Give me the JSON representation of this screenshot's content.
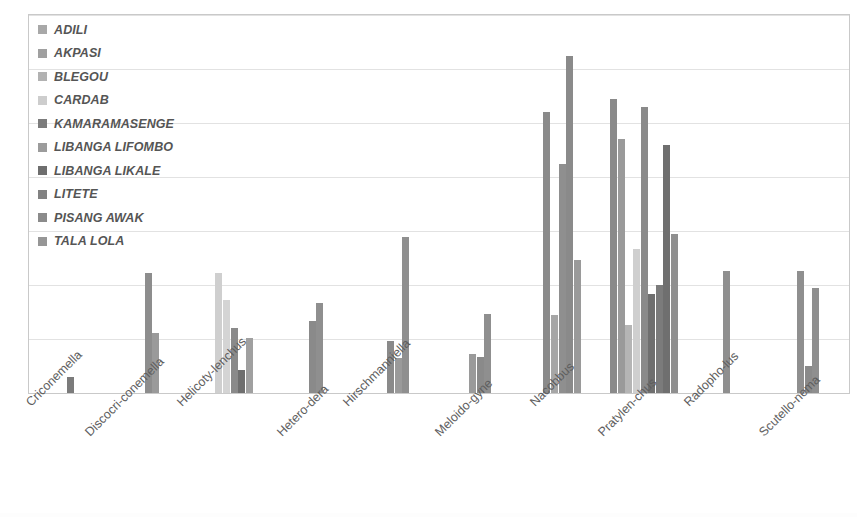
{
  "chart_data": {
    "type": "bar",
    "title": "",
    "subtitle": "",
    "xlabel": "",
    "ylabel": "",
    "ylim": [
      0,
      35
    ],
    "yticks": [
      0,
      5,
      10,
      15,
      20,
      25,
      30,
      35
    ],
    "grid": true,
    "legend_position": "top-left inside plot",
    "orientation": "vertical grouped",
    "categories": [
      "Criconemella",
      "Discocri-conemella",
      "Helicoty-lenchus",
      "Hetero-dera",
      "Hirschmanniella",
      "Meloido-gyne",
      "Nacobbus",
      "Pratylen-chus",
      "Radopho-lus",
      "Scutello-nema"
    ],
    "series": [
      {
        "name": "ADILI",
        "color": "#a6a6a6",
        "values": [
          0,
          0,
          0,
          0,
          0,
          0,
          26.0,
          27.2,
          11.3,
          0
        ]
      },
      {
        "name": "AKPASI",
        "color": "#9c9c9c",
        "values": [
          0,
          0,
          0,
          0,
          0,
          0,
          7.2,
          23.5,
          0,
          0
        ]
      },
      {
        "name": "BLEGOU",
        "color": "#b0b0b0",
        "values": [
          0,
          0,
          11.1,
          0,
          0,
          0,
          21.2,
          6.3,
          0,
          0
        ]
      },
      {
        "name": "CARDAB",
        "color": "#cfcfcf",
        "values": [
          0,
          0,
          8.6,
          0,
          0,
          0,
          0,
          13.3,
          0,
          0
        ]
      },
      {
        "name": "KAMARAMASENGE",
        "color": "#7b7b7b",
        "values": [
          1.5,
          0,
          6.0,
          0,
          4.8,
          3.6,
          31.2,
          26.5,
          0,
          11.3
        ]
      },
      {
        "name": "LIBANGA LIFOMBO",
        "color": "#9a9a9a",
        "values": [
          0,
          11.1,
          2.1,
          0,
          3.2,
          3.3,
          12.3,
          9.2,
          0,
          2.5
        ]
      },
      {
        "name": "LIBANGA LIKALE",
        "color": "#6f6f6f",
        "values": [
          0,
          5.6,
          5.1,
          6.7,
          0,
          0,
          0,
          10.0,
          0,
          9.7
        ]
      },
      {
        "name": "LITETE",
        "color": "#808080",
        "values": [
          0,
          0,
          0,
          8.3,
          0,
          7.3,
          0,
          23.0,
          0,
          0
        ]
      },
      {
        "name": "PISANG AWAK",
        "color": "#8a8a8a",
        "values": [
          0,
          0,
          0,
          0,
          14.4,
          0,
          0,
          14.7,
          0,
          0
        ]
      },
      {
        "name": "TALA LOLA",
        "color": "#949494",
        "values": [
          0,
          0,
          0,
          0,
          0,
          0,
          0,
          0,
          0,
          0
        ]
      }
    ],
    "bars": [
      {
        "category": "Criconemella",
        "bars": [
          {
            "series": "KAMARAMASENGE",
            "value": 1.5,
            "color": "#7b7b7b"
          }
        ]
      },
      {
        "category": "Discocri-conemella",
        "bars": [
          {
            "series": "LIBANGA LIFOMBO",
            "value": 11.1,
            "color": "#8d8d8d"
          },
          {
            "series": "LIBANGA LIKALE",
            "value": 5.6,
            "color": "#9a9a9a"
          }
        ]
      },
      {
        "category": "Helicoty-lenchus",
        "bars": [
          {
            "series": "CARDAB",
            "value": 11.1,
            "color": "#cfcfcf"
          },
          {
            "series": "CARDAB-2",
            "value": 8.6,
            "color": "#d4d4d4"
          },
          {
            "series": "KAMARAMASENGE",
            "value": 6.0,
            "color": "#8a8a8a"
          },
          {
            "series": "LIBANGA LIFOMBO",
            "value": 2.1,
            "color": "#6f6f6f"
          },
          {
            "series": "LIBANGA LIKALE",
            "value": 5.1,
            "color": "#a0a0a0"
          }
        ]
      },
      {
        "category": "Hetero-dera",
        "bars": [
          {
            "series": "LIBANGA LIKALE",
            "value": 6.7,
            "color": "#8a8a8a"
          },
          {
            "series": "LITETE",
            "value": 8.3,
            "color": "#8f8f8f"
          }
        ]
      },
      {
        "category": "Hirschmanniella",
        "bars": [
          {
            "series": "KAMARAMASENGE",
            "value": 4.8,
            "color": "#8a8a8a"
          },
          {
            "series": "LIBANGA LIFOMBO",
            "value": 3.2,
            "color": "#9a9a9a"
          },
          {
            "series": "PISANG AWAK",
            "value": 14.4,
            "color": "#8f8f8f"
          }
        ]
      },
      {
        "category": "Meloido-gyne",
        "bars": [
          {
            "series": "KAMARAMASENGE",
            "value": 3.6,
            "color": "#9a9a9a"
          },
          {
            "series": "LIBANGA LIFOMBO",
            "value": 3.3,
            "color": "#8a8a8a"
          },
          {
            "series": "LITETE",
            "value": 7.3,
            "color": "#8f8f8f"
          }
        ]
      },
      {
        "category": "Nacobbus",
        "bars": [
          {
            "series": "ADILI",
            "value": 26.0,
            "color": "#8a8a8a"
          },
          {
            "series": "AKPASI",
            "value": 7.2,
            "color": "#a6a6a6"
          },
          {
            "series": "BLEGOU",
            "value": 21.2,
            "color": "#8f8f8f"
          },
          {
            "series": "KAMARAMASENGE",
            "value": 31.2,
            "color": "#8a8a8a"
          },
          {
            "series": "LIBANGA LIFOMBO",
            "value": 12.3,
            "color": "#9a9a9a"
          }
        ]
      },
      {
        "category": "Pratylen-chus",
        "bars": [
          {
            "series": "ADILI",
            "value": 27.2,
            "color": "#8a8a8a"
          },
          {
            "series": "AKPASI",
            "value": 23.5,
            "color": "#9a9a9a"
          },
          {
            "series": "BLEGOU",
            "value": 6.3,
            "color": "#b5b5b5"
          },
          {
            "series": "CARDAB",
            "value": 13.3,
            "color": "#cfcfcf"
          },
          {
            "series": "KAMARAMASENGE",
            "value": 26.5,
            "color": "#8a8a8a"
          },
          {
            "series": "LIBANGA LIFOMBO",
            "value": 9.2,
            "color": "#6f6f6f"
          },
          {
            "series": "LIBANGA LIKALE",
            "value": 10.0,
            "color": "#7b7b7b"
          },
          {
            "series": "LITETE",
            "value": 23.0,
            "color": "#6f6f6f"
          },
          {
            "series": "PISANG AWAK",
            "value": 14.7,
            "color": "#8f8f8f"
          }
        ]
      },
      {
        "category": "Radopho-lus",
        "bars": [
          {
            "series": "ADILI",
            "value": 11.3,
            "color": "#8f8f8f"
          }
        ]
      },
      {
        "category": "Scutello-nema",
        "bars": [
          {
            "series": "KAMARAMASENGE",
            "value": 11.3,
            "color": "#8f8f8f"
          },
          {
            "series": "LIBANGA LIFOMBO",
            "value": 2.5,
            "color": "#8a8a8a"
          },
          {
            "series": "LIBANGA LIKALE",
            "value": 9.7,
            "color": "#8f8f8f"
          }
        ]
      }
    ]
  },
  "legend": {
    "items": [
      {
        "label": "ADILI",
        "color": "#a8a8a8"
      },
      {
        "label": "AKPASI",
        "color": "#a0a0a0"
      },
      {
        "label": "BLEGOU",
        "color": "#b2b2b2"
      },
      {
        "label": "CARDAB",
        "color": "#cdcdcd"
      },
      {
        "label": "KAMARAMASENGE",
        "color": "#7c7c7c"
      },
      {
        "label": "LIBANGA LIFOMBO",
        "color": "#9c9c9c"
      },
      {
        "label": "LIBANGA LIKALE",
        "color": "#6e6e6e"
      },
      {
        "label": "LITETE",
        "color": "#828282"
      },
      {
        "label": "PISANG AWAK",
        "color": "#8b8b8b"
      },
      {
        "label": "TALA LOLA",
        "color": "#969696"
      }
    ]
  },
  "style": {
    "plot_background": "#ffffff",
    "grid_color": "#e2e2e2",
    "axis_color": "#c9c9c9",
    "tick_label_color": "#6d6d6d"
  }
}
